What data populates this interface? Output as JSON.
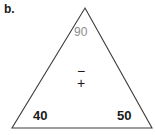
{
  "figure": {
    "part_label": "b.",
    "shape": "triangle",
    "stroke_color": "#3b3b3b",
    "background_color": "#ffffff",
    "vertices": {
      "apex": [
        85,
        8
      ],
      "bottom_left": [
        12,
        128
      ],
      "bottom_right": [
        152,
        128
      ]
    },
    "angles": {
      "top": {
        "value": "90",
        "color": "#8c8c8c",
        "bold": false
      },
      "bottom_left": {
        "value": "40",
        "color": "#1a1a1a",
        "bold": true
      },
      "bottom_right": {
        "value": "50",
        "color": "#1a1a1a",
        "bold": true
      }
    },
    "center_signs": {
      "minus": "−",
      "plus": "+"
    }
  }
}
